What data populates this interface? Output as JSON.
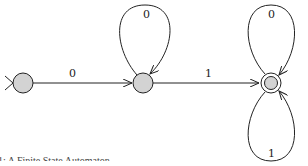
{
  "diagram": {
    "type": "finite-state-automaton",
    "caption": "1: A Finite State Automaton",
    "states": [
      {
        "id": "q0",
        "initial": true,
        "accepting": false
      },
      {
        "id": "q1",
        "initial": false,
        "accepting": false
      },
      {
        "id": "q2",
        "initial": false,
        "accepting": true
      }
    ],
    "transitions": [
      {
        "from": "q0",
        "to": "q1",
        "label": "0"
      },
      {
        "from": "q1",
        "to": "q1",
        "label": "0"
      },
      {
        "from": "q1",
        "to": "q2",
        "label": "1"
      },
      {
        "from": "q2",
        "to": "q2",
        "label": "0"
      },
      {
        "from": "q2",
        "to": "q2",
        "label": "1"
      }
    ],
    "colors": {
      "state_fill": "#d3d3d3",
      "stroke": "#222222"
    }
  }
}
